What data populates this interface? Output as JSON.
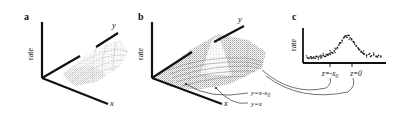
{
  "figure": {
    "background_color": "#ffffff",
    "ink_color": "#111111"
  },
  "panels": [
    {
      "id": "a",
      "letter": "a",
      "type": "3d-surface",
      "axes": {
        "vertical_label": "rate",
        "depth_label": "y",
        "horizontal_label": "x"
      },
      "surface_description": "broad rough dome, light stippled mesh",
      "annotations": []
    },
    {
      "id": "b",
      "letter": "b",
      "type": "3d-surface",
      "axes": {
        "vertical_label": "rate",
        "depth_label": "y",
        "horizontal_label": "x"
      },
      "surface_description": "ridged surface with sharp central peak and diagonal ridge lines",
      "annotations": [
        {
          "label": "y=x-x",
          "subscript": "0"
        },
        {
          "label": "y=x",
          "subscript": ""
        }
      ]
    },
    {
      "id": "c",
      "letter": "c",
      "type": "scatter",
      "axes": {
        "vertical_label": "rate",
        "horizontal_label": ""
      },
      "tick_labels": [
        {
          "label": "z=-x",
          "subscript": "0"
        },
        {
          "label": "z=0",
          "subscript": ""
        }
      ],
      "annotations": []
    }
  ],
  "chart_data": [
    {
      "type": "surface",
      "panel": "a",
      "title": "",
      "xlabel": "x",
      "ylabel": "y",
      "zlabel": "rate",
      "grid": false,
      "description": "Smooth broad bump over the x-y plane; rate rises to a rounded plateau in the middle of the field, no sharp ridge.",
      "peak_height_rel": 0.55,
      "peak_position": [
        0.5,
        0.45
      ]
    },
    {
      "type": "surface",
      "panel": "b",
      "title": "",
      "xlabel": "x",
      "ylabel": "y",
      "zlabel": "rate",
      "grid": false,
      "description": "Surface with a sharp narrow peak plus long diagonal ridges running parallel to the lines y=x and y=x-x0.",
      "peak_height_rel": 1.0,
      "peak_position": [
        0.42,
        0.35
      ],
      "ridge_lines": [
        "y=x-x0",
        "y=x"
      ]
    },
    {
      "type": "scatter",
      "panel": "c",
      "title": "",
      "xlabel": "",
      "ylabel": "rate",
      "grid": false,
      "xticks": [
        "z=-x0",
        "z=0"
      ],
      "xtick_positions": [
        0.42,
        0.66
      ],
      "x": [
        0.03,
        0.05,
        0.07,
        0.09,
        0.11,
        0.13,
        0.15,
        0.17,
        0.19,
        0.21,
        0.23,
        0.25,
        0.27,
        0.29,
        0.31,
        0.33,
        0.35,
        0.37,
        0.39,
        0.41,
        0.43,
        0.45,
        0.47,
        0.49,
        0.51,
        0.53,
        0.55,
        0.57,
        0.59,
        0.61,
        0.63,
        0.65,
        0.67,
        0.69,
        0.71,
        0.73,
        0.75,
        0.78,
        0.81,
        0.84,
        0.87,
        0.9,
        0.93,
        0.96
      ],
      "y": [
        0.14,
        0.12,
        0.17,
        0.13,
        0.16,
        0.12,
        0.18,
        0.15,
        0.19,
        0.16,
        0.21,
        0.18,
        0.24,
        0.22,
        0.27,
        0.31,
        0.29,
        0.36,
        0.42,
        0.47,
        0.55,
        0.62,
        0.7,
        0.78,
        0.84,
        0.8,
        0.86,
        0.78,
        0.72,
        0.66,
        0.58,
        0.52,
        0.46,
        0.4,
        0.34,
        0.3,
        0.26,
        0.22,
        0.25,
        0.2,
        0.23,
        0.18,
        0.21,
        0.17
      ],
      "ylim": [
        0,
        1
      ],
      "xlim": [
        0,
        1
      ]
    }
  ]
}
